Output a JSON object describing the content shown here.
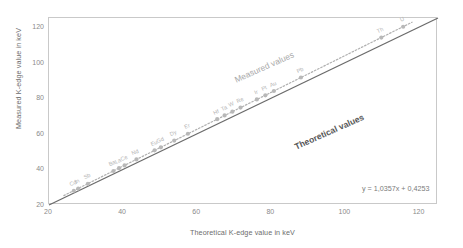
{
  "chart_data": {
    "type": "scatter",
    "title": "",
    "xlabel": "Theoretical K-edge value in keV",
    "ylabel": "Measured K-edge value in keV",
    "xlim": [
      20,
      125
    ],
    "ylim": [
      20,
      125
    ],
    "xticks": [
      20,
      40,
      60,
      80,
      100,
      120
    ],
    "yticks": [
      20,
      40,
      60,
      80,
      100,
      120
    ],
    "grid": false,
    "legend_position": "inline-annotations",
    "annotations": [
      {
        "text": "Measured values",
        "kind": "series-label-dotted-trendline"
      },
      {
        "text": "Theoretical values",
        "kind": "series-label-identity-line"
      },
      {
        "text": "y = 1,0357x + 0,4253",
        "kind": "regression-equation"
      }
    ],
    "regression": {
      "equation": "y = 1,0357x + 0,4253",
      "slope": 1.0357,
      "intercept": 0.4253
    },
    "reference_line": {
      "name": "Theoretical values",
      "slope": 1,
      "intercept": 0,
      "style": "solid"
    },
    "trendline": {
      "name": "Measured values",
      "style": "dotted"
    },
    "series": [
      {
        "name": "Measured values",
        "point_labels": [
          "Cd",
          "In",
          "Sb",
          "Ba",
          "La",
          "Ce",
          "Nd",
          "Eu",
          "Gd",
          "Dy",
          "Er",
          "Hf",
          "Ta",
          "W",
          "Re",
          "Ir",
          "Pt",
          "Au",
          "Pb",
          "Th",
          "U"
        ],
        "x": [
          26.7,
          27.9,
          30.5,
          37.4,
          38.9,
          40.4,
          43.6,
          48.5,
          50.2,
          53.8,
          57.5,
          65.4,
          67.4,
          69.5,
          71.7,
          76.1,
          78.4,
          80.7,
          88.0,
          109.7,
          115.6
        ],
        "y": [
          28.0,
          29.2,
          31.9,
          39.1,
          40.7,
          42.2,
          45.6,
          50.7,
          52.4,
          56.2,
          60.0,
          68.2,
          70.3,
          72.4,
          74.7,
          79.3,
          81.6,
          84.0,
          91.6,
          114.0,
          120.1
        ]
      }
    ]
  }
}
